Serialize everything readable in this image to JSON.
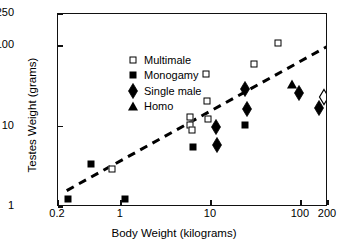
{
  "chart_data": {
    "type": "scatter",
    "title": "",
    "xlabel": "Body Weight (kilograms)",
    "ylabel": "Testes Weight (grams)",
    "xscale": "log",
    "yscale": "log",
    "xlim": [
      0.2,
      200
    ],
    "ylim": [
      1,
      250
    ],
    "xticks": [
      "0.2",
      "1",
      "10",
      "100",
      "200"
    ],
    "xtick_values": [
      0.2,
      1,
      10,
      100,
      200
    ],
    "yticks": [
      "250",
      "100",
      "10",
      "1"
    ],
    "ytick_values": [
      250,
      100,
      10,
      1
    ],
    "grid": false,
    "legend_position": "upper-left",
    "legend": [
      {
        "label": "Multimale",
        "marker": "open-square"
      },
      {
        "label": "Monogamy",
        "marker": "filled-square"
      },
      {
        "label": "Single male",
        "marker": "filled-diamond"
      },
      {
        "label": "Homo",
        "marker": "filled-triangle"
      }
    ],
    "series": [
      {
        "name": "Multimale",
        "marker": "open-square",
        "points": [
          {
            "x": 0.8,
            "y": 3.0
          },
          {
            "x": 5.8,
            "y": 13.0
          },
          {
            "x": 5.9,
            "y": 10.3
          },
          {
            "x": 6.2,
            "y": 9.0
          },
          {
            "x": 8.8,
            "y": 45.0
          },
          {
            "x": 9.0,
            "y": 21.0
          },
          {
            "x": 9.2,
            "y": 12.5
          },
          {
            "x": 30.0,
            "y": 60.0
          },
          {
            "x": 55.0,
            "y": 110.0
          }
        ]
      },
      {
        "name": "Monogamy",
        "marker": "filled-square",
        "points": [
          {
            "x": 0.26,
            "y": 1.25
          },
          {
            "x": 0.46,
            "y": 3.4
          },
          {
            "x": 1.1,
            "y": 1.25
          },
          {
            "x": 6.3,
            "y": 5.6
          },
          {
            "x": 24.0,
            "y": 10.5
          }
        ]
      },
      {
        "name": "Single male",
        "marker": "filled-diamond",
        "points": [
          {
            "x": 11.5,
            "y": 9.8
          },
          {
            "x": 11.8,
            "y": 5.9
          },
          {
            "x": 24.0,
            "y": 29.0
          },
          {
            "x": 25.0,
            "y": 16.5
          },
          {
            "x": 95.0,
            "y": 26.0
          },
          {
            "x": 160.0,
            "y": 17.0
          }
        ]
      },
      {
        "name": "Homo",
        "marker": "filled-triangle",
        "points": [
          {
            "x": 80.0,
            "y": 34.0
          }
        ]
      },
      {
        "name": "Unclassified",
        "marker": "open-diamond",
        "points": [
          {
            "x": 180.0,
            "y": 23.0
          }
        ]
      }
    ],
    "trendline": {
      "style": "dashed",
      "x_start": 0.25,
      "y_start": 1.6,
      "x_end": 200.0,
      "y_end": 100.0
    }
  }
}
